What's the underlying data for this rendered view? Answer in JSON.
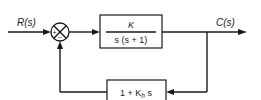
{
  "diagram": {
    "type": "block-diagram",
    "input_label": "R(s)",
    "output_label": "C(s)",
    "summing_junction": {
      "plus_sign": "+",
      "minus_sign": "−"
    },
    "forward_block": {
      "numerator": "K",
      "denominator": "s (s + 1)"
    },
    "feedback_block": {
      "expr_prefix": "1 + K",
      "expr_subscript": "h",
      "expr_suffix": " s"
    },
    "colors": {
      "line": "#1a1a1a",
      "background": "#ffffff"
    }
  }
}
